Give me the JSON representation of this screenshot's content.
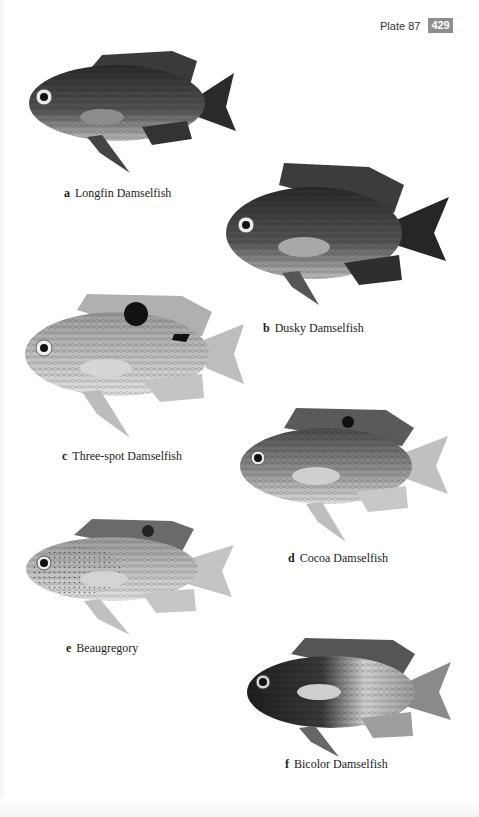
{
  "header": {
    "plate_label": "Plate 87",
    "page_number": "429",
    "badge_color": "#8e8e8e"
  },
  "species": [
    {
      "letter": "a",
      "name": "Longfin Damselfish",
      "shading": "dark",
      "spot": "none"
    },
    {
      "letter": "b",
      "name": "Dusky Damselfish",
      "shading": "dark",
      "spot": "none"
    },
    {
      "letter": "c",
      "name": "Three-spot Damselfish",
      "shading": "light",
      "spot": "black dorsal spot and caudal saddle"
    },
    {
      "letter": "d",
      "name": "Cocoa Damselfish",
      "shading": "medium",
      "spot": "small dorsal spot"
    },
    {
      "letter": "e",
      "name": "Beaugregory",
      "shading": "light-spotted",
      "spot": "dorsal fin spot"
    },
    {
      "letter": "f",
      "name": "Bicolor Damselfish",
      "shading": "dark front, pale rear",
      "spot": "none"
    }
  ]
}
